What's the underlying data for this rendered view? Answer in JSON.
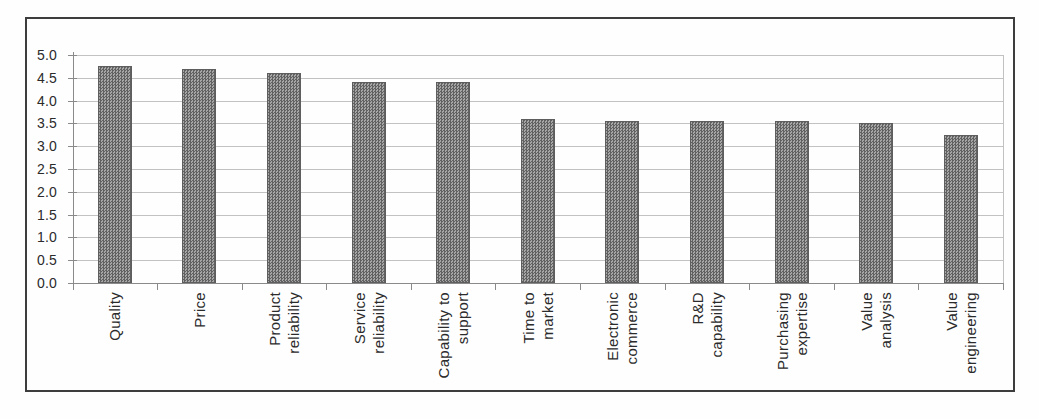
{
  "figure": {
    "title": "",
    "page_bg": "#fefefe",
    "frame_color": "#3d3d3d"
  },
  "chart_data": {
    "type": "bar",
    "title": "",
    "xlabel": "",
    "ylabel": "",
    "categories": [
      "Quality",
      "Price",
      "Product reliability",
      "Service reliability",
      "Capability to support",
      "Time to market",
      "Electronic commerce",
      "R&D capability",
      "Purchasing expertise",
      "Value analysis",
      "Value engineering"
    ],
    "category_lines": [
      [
        "Quality"
      ],
      [
        "Price"
      ],
      [
        "Product",
        "reliability"
      ],
      [
        "Service",
        "reliability"
      ],
      [
        "Capability to",
        "support"
      ],
      [
        "Time to",
        "market"
      ],
      [
        "Electronic",
        "commerce"
      ],
      [
        "R&D",
        "capability"
      ],
      [
        "Purchasing",
        "expertise"
      ],
      [
        "Value",
        "analysis"
      ],
      [
        "Value",
        "engineering"
      ]
    ],
    "values": [
      4.75,
      4.7,
      4.6,
      4.4,
      4.4,
      3.6,
      3.55,
      3.55,
      3.55,
      3.5,
      3.25
    ],
    "ylim": [
      0,
      5
    ],
    "ytick_step": 0.5,
    "ytick_labels": [
      "0.0",
      "0.5",
      "1.0",
      "1.5",
      "2.0",
      "2.5",
      "3.0",
      "3.5",
      "4.0",
      "4.5",
      "5.0"
    ],
    "grid": true,
    "legend": false,
    "x_labels_rotation_deg": -90,
    "colors": {
      "bar_dark": "#616161",
      "bar_light": "#a6a6a6",
      "grid": "#c2c2c2",
      "axis": "#8a8a8a",
      "text": "#2b2b2b"
    }
  }
}
